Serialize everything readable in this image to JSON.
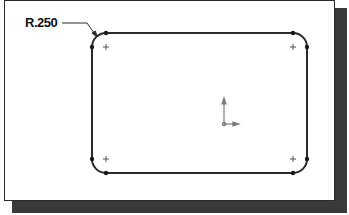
{
  "drawing": {
    "dimension_label": "R.250",
    "rectangle": {
      "left": 92,
      "top": 33,
      "right": 307,
      "bottom": 173,
      "corner_radius": 14
    },
    "centerpoints": [
      {
        "x": 106,
        "y": 47
      },
      {
        "x": 293,
        "y": 47
      },
      {
        "x": 106,
        "y": 159
      },
      {
        "x": 293,
        "y": 159
      }
    ],
    "origin": {
      "x": 224,
      "y": 124
    },
    "colors": {
      "line": "#2b2b2b",
      "shadow": "#3a3a3a",
      "background": "#ffffff",
      "origin": "#7a7a7a"
    },
    "icons": {
      "origin": "origin-axes-icon",
      "centerpoint": "plus-icon"
    }
  }
}
